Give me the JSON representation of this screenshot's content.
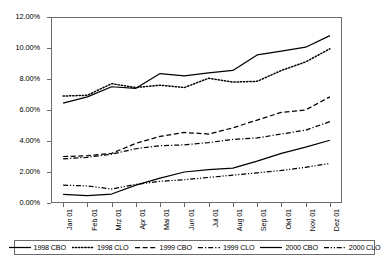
{
  "chart_data": {
    "type": "line",
    "title": "",
    "xlabel": "",
    "ylabel": "",
    "ylim": [
      0,
      12
    ],
    "ytick_labels": [
      "12.00%",
      "10.00%",
      "8.00%",
      "6.00%",
      "4.00%",
      "2.00%",
      "0.00%"
    ],
    "ytick_values": [
      12,
      10,
      8,
      6,
      4,
      2,
      0
    ],
    "grid": false,
    "legend_position": "bottom",
    "categories": [
      "Jan 01",
      "Feb 01",
      "Mrz 01",
      "Apr 01",
      "Mai 01",
      "Jun 01",
      "Jul 01",
      "Aug 01",
      "Sep 01",
      "Okt 01",
      "Nov 01",
      "Dez 01"
    ],
    "series": [
      {
        "name": "1998 CBO",
        "style": "solid",
        "values": [
          6.45,
          6.85,
          7.5,
          7.4,
          8.35,
          8.2,
          8.4,
          8.55,
          9.55,
          9.8,
          10.05,
          10.8
        ]
      },
      {
        "name": "1998 CLO",
        "style": "dotted",
        "values": [
          6.9,
          6.95,
          7.7,
          7.45,
          7.6,
          7.45,
          8.05,
          7.8,
          7.85,
          8.55,
          9.1,
          9.95
        ]
      },
      {
        "name": "1999 CBO",
        "style": "dashed",
        "values": [
          3.0,
          3.05,
          3.2,
          3.85,
          4.3,
          4.55,
          4.45,
          4.85,
          5.35,
          5.85,
          6.0,
          6.85
        ]
      },
      {
        "name": "1999 CLO",
        "style": "dash-dot",
        "values": [
          2.85,
          2.95,
          3.15,
          3.5,
          3.7,
          3.75,
          3.9,
          4.1,
          4.2,
          4.45,
          4.7,
          5.25
        ]
      },
      {
        "name": "2000 CBO",
        "style": "solid",
        "values": [
          0.55,
          0.48,
          0.58,
          1.15,
          1.6,
          2.0,
          2.15,
          2.25,
          2.7,
          3.2,
          3.6,
          4.05
        ]
      },
      {
        "name": "2000 CLO",
        "style": "dash-dot-dot",
        "values": [
          1.15,
          1.1,
          0.9,
          1.2,
          1.4,
          1.5,
          1.65,
          1.8,
          1.95,
          2.1,
          2.3,
          2.55
        ]
      }
    ]
  },
  "legend": {
    "entries": [
      {
        "label": "1998 CBO",
        "style": "solid"
      },
      {
        "label": "1998 CLO",
        "style": "dotted"
      },
      {
        "label": "1999 CBO",
        "style": "dashed"
      },
      {
        "label": "1999 CLO",
        "style": "dash-dot"
      },
      {
        "label": "2000 CBO",
        "style": "solid"
      },
      {
        "label": "2000 CLO",
        "style": "dash-dot-dot"
      }
    ]
  },
  "colors": {
    "line": "#000000",
    "axis": "#6b6b6b",
    "background": "#ffffff"
  }
}
